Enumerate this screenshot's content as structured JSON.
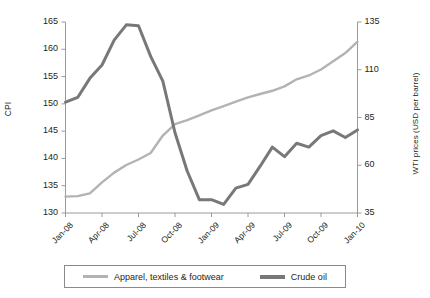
{
  "chart_data": {
    "type": "line",
    "title": "",
    "xlabel": "",
    "ylabel": "CPI",
    "y2label": "WTI prices (USD per barrel)",
    "grid": false,
    "legend_position": "bottom",
    "x": [
      "Jan-08",
      "Feb-08",
      "Mar-08",
      "Apr-08",
      "May-08",
      "Jun-08",
      "Jul-08",
      "Aug-08",
      "Sep-08",
      "Oct-08",
      "Nov-08",
      "Dec-08",
      "Jan-09",
      "Feb-09",
      "Mar-09",
      "Apr-09",
      "May-09",
      "Jun-09",
      "Jul-09",
      "Aug-09",
      "Sep-09",
      "Oct-09",
      "Nov-09",
      "Dec-09",
      "Jan-10"
    ],
    "xticklabels": [
      "Jan-08",
      "Apr-08",
      "Jul-08",
      "Oct-08",
      "Jan-09",
      "Apr-09",
      "Jul-09",
      "Oct-09",
      "Jan-10"
    ],
    "ylim": [
      130,
      165
    ],
    "yticks": [
      130,
      135,
      140,
      145,
      150,
      155,
      160,
      165
    ],
    "y2lim": [
      35,
      135
    ],
    "y2ticks": [
      35,
      60,
      85,
      110,
      135
    ],
    "series": [
      {
        "name": "Apparel, textiles & footwear",
        "axis": "left",
        "color": "#b3b3b3",
        "values": [
          133.0,
          133.1,
          133.6,
          135.6,
          137.4,
          138.8,
          139.8,
          141.0,
          144.2,
          146.3,
          147.0,
          147.9,
          148.8,
          149.6,
          150.4,
          151.2,
          151.8,
          152.4,
          153.2,
          154.5,
          155.2,
          156.3,
          157.8,
          159.3,
          161.4
        ]
      },
      {
        "name": "Crude oil",
        "axis": "right",
        "color": "#787878",
        "values": [
          93.0,
          95.5,
          105.5,
          112.5,
          125.5,
          133.5,
          133.0,
          117.0,
          104.0,
          77.0,
          57.0,
          42.0,
          42.0,
          39.5,
          48.0,
          50.0,
          59.5,
          69.5,
          64.5,
          71.5,
          69.5,
          75.5,
          78.0,
          74.5,
          78.5
        ]
      }
    ]
  },
  "legend": {
    "entries": [
      {
        "label": "Apparel, textiles & footwear"
      },
      {
        "label": "Crude oil"
      }
    ]
  },
  "colors": {
    "apparel": "#b3b3b3",
    "crude_oil": "#787878",
    "axis": "#9a9a9a",
    "text": "#231f20"
  }
}
